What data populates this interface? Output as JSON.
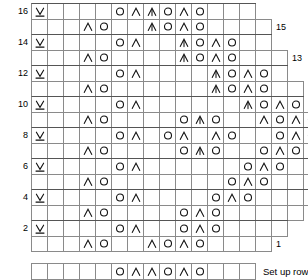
{
  "legend": {
    "setup_row_label": "Set up row"
  },
  "symbols": {
    "blank": "",
    "yo": "yarn-over",
    "k2tog": "decrease-left-leaning",
    "cdd": "central-double-decrease",
    "slip": "slip-stitch-v-underline"
  },
  "grid": {
    "cell_width": 16,
    "cell_height": 15.5,
    "columns_min": 14,
    "columns_max": 20,
    "origin_x": 31,
    "origin_y": 3
  },
  "chart_data": {
    "type": "table",
    "xlabel": "",
    "ylabel": "",
    "row_numbers_left": [
      "16",
      "14",
      "12",
      "10",
      "8",
      "6",
      "4",
      "2"
    ],
    "row_numbers_right": [
      "15",
      "13",
      "11",
      "9",
      "7",
      "5",
      "3",
      "1"
    ],
    "rows": [
      {
        "number": "16",
        "side": "left",
        "offset": 0,
        "width": 14,
        "cells": [
          "slip",
          "",
          "",
          "",
          "",
          "yo",
          "k2tog",
          "cdd",
          "yo",
          "k2tog",
          "yo",
          "",
          "",
          ""
        ]
      },
      {
        "number": "15",
        "side": "right",
        "offset": 0,
        "width": 15,
        "cells": [
          "",
          "",
          "",
          "k2tog",
          "yo",
          "",
          "",
          "cdd",
          "yo",
          "k2tog",
          "yo",
          "",
          "",
          "",
          ""
        ]
      },
      {
        "number": "14",
        "side": "left",
        "offset": 0,
        "width": 15,
        "cells": [
          "slip",
          "",
          "",
          "",
          "",
          "yo",
          "k2tog",
          "",
          "",
          "cdd",
          "yo",
          "k2tog",
          "yo",
          "",
          ""
        ]
      },
      {
        "number": "13",
        "side": "right",
        "offset": 0,
        "width": 16,
        "cells": [
          "",
          "",
          "",
          "k2tog",
          "yo",
          "",
          "",
          "",
          "",
          "cdd",
          "yo",
          "k2tog",
          "yo",
          "",
          "",
          ""
        ]
      },
      {
        "number": "12",
        "side": "left",
        "offset": 0,
        "width": 16,
        "cells": [
          "slip",
          "",
          "",
          "",
          "",
          "yo",
          "k2tog",
          "",
          "",
          "",
          "",
          "cdd",
          "yo",
          "k2tog",
          "yo",
          ""
        ]
      },
      {
        "number": "11",
        "side": "right",
        "offset": 0,
        "width": 17,
        "cells": [
          "",
          "",
          "",
          "k2tog",
          "yo",
          "",
          "",
          "",
          "",
          "",
          "",
          "cdd",
          "yo",
          "k2tog",
          "yo",
          "",
          ""
        ]
      },
      {
        "number": "10",
        "side": "left",
        "offset": 0,
        "width": 17,
        "cells": [
          "slip",
          "",
          "",
          "",
          "",
          "yo",
          "k2tog",
          "",
          "",
          "",
          "",
          "",
          "",
          "cdd",
          "yo",
          "k2tog",
          "yo"
        ]
      },
      {
        "number": "9",
        "side": "right",
        "offset": 0,
        "width": 18,
        "cells": [
          "",
          "",
          "",
          "k2tog",
          "yo",
          "",
          "",
          "",
          "",
          "yo",
          "cdd",
          "yo",
          "",
          "",
          "k2tog",
          "yo",
          "k2tog",
          "yo"
        ]
      },
      {
        "number": "8",
        "side": "left",
        "offset": 0,
        "width": 18,
        "cells": [
          "slip",
          "",
          "",
          "",
          "",
          "yo",
          "k2tog",
          "",
          "yo",
          "k2tog",
          "",
          "k2tog",
          "yo",
          "",
          "",
          "yo",
          "k2tog",
          "yo"
        ]
      },
      {
        "number": "7",
        "side": "right",
        "offset": 0,
        "width": 19,
        "cells": [
          "",
          "",
          "",
          "k2tog",
          "yo",
          "",
          "",
          "",
          "",
          "yo",
          "cdd",
          "yo",
          "",
          "",
          "yo",
          "k2tog",
          "yo",
          "",
          ""
        ]
      },
      {
        "number": "6",
        "side": "left",
        "offset": 0,
        "width": 19,
        "cells": [
          "slip",
          "",
          "",
          "",
          "",
          "yo",
          "k2tog",
          "",
          "",
          "",
          "",
          "",
          "",
          "yo",
          "k2tog",
          "yo",
          "",
          "",
          ""
        ]
      },
      {
        "number": "5",
        "side": "right",
        "offset": 0,
        "width": 20,
        "cells": [
          "",
          "",
          "",
          "k2tog",
          "yo",
          "",
          "",
          "",
          "",
          "",
          "",
          "",
          "yo",
          "k2tog",
          "yo",
          "",
          "",
          "",
          "",
          ""
        ]
      },
      {
        "number": "4",
        "side": "left",
        "offset": 0,
        "width": 18,
        "cells": [
          "slip",
          "",
          "",
          "",
          "",
          "yo",
          "k2tog",
          "",
          "",
          "",
          "",
          "yo",
          "k2tog",
          "yo",
          "",
          "",
          "",
          ""
        ]
      },
      {
        "number": "3",
        "side": "right",
        "offset": 0,
        "width": 17,
        "cells": [
          "",
          "",
          "",
          "k2tog",
          "yo",
          "",
          "",
          "",
          "",
          "yo",
          "k2tog",
          "yo",
          "",
          "",
          "",
          "",
          ""
        ]
      },
      {
        "number": "2",
        "side": "left",
        "offset": 0,
        "width": 16,
        "cells": [
          "slip",
          "",
          "",
          "",
          "",
          "yo",
          "k2tog",
          "",
          "",
          "yo",
          "k2tog",
          "yo",
          "",
          "",
          "",
          ""
        ]
      },
      {
        "number": "1",
        "side": "right",
        "offset": 0,
        "width": 15,
        "cells": [
          "",
          "",
          "",
          "k2tog",
          "yo",
          "",
          "",
          "k2tog",
          "yo",
          "k2tog",
          "yo",
          "",
          "",
          "",
          ""
        ]
      },
      {
        "number": "setup",
        "side": "none",
        "offset": 0,
        "width": 14,
        "cells": [
          "",
          "",
          "",
          "",
          "",
          "yo",
          "k2tog",
          "k2tog",
          "yo",
          "k2tog",
          "yo",
          "",
          "",
          ""
        ]
      }
    ]
  }
}
